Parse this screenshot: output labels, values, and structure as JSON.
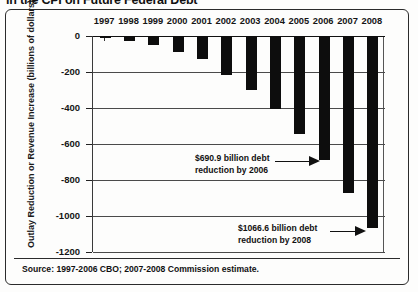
{
  "figure": {
    "title": "in the CPI on Future Federal Debt",
    "source_note": "Source: 1997-2006 CBO; 2007-2008 Commission estimate."
  },
  "annotations": [
    {
      "name": "annotation-2006",
      "line1": "$690.9 billion debt",
      "line2": "reduction by 2006"
    },
    {
      "name": "annotation-2008",
      "line1": "$1066.6 billion debt",
      "line2": "reduction by 2008"
    }
  ],
  "chart_data": {
    "type": "bar",
    "title": "in the CPI on Future Federal Debt",
    "xlabel": "",
    "ylabel": "Outlay Reduction or Revenue Increase (billions of dollars)",
    "categories": [
      "1997",
      "1998",
      "1999",
      "2000",
      "2001",
      "2002",
      "2003",
      "2004",
      "2005",
      "2006",
      "2007",
      "2008"
    ],
    "values": [
      -10,
      -25,
      -50,
      -90,
      -130,
      -215,
      -300,
      -405,
      -545,
      -690.9,
      -870,
      -1066.6
    ],
    "ylim": [
      -1200,
      0
    ],
    "yticks": [
      0,
      -200,
      -400,
      -600,
      -800,
      -1000,
      -1200
    ],
    "ytick_labels": [
      "0",
      "-200",
      "-400",
      "-600",
      "-800",
      "-1000",
      "-1200"
    ],
    "grid": true,
    "legend": "none",
    "bar_color": "#0d0d0d",
    "x_axis_position": "top",
    "data_labels": [
      {
        "category": "2006",
        "label": "$690.9 billion debt reduction by 2006"
      },
      {
        "category": "2008",
        "label": "$1066.6 billion debt reduction by 2008"
      }
    ]
  }
}
